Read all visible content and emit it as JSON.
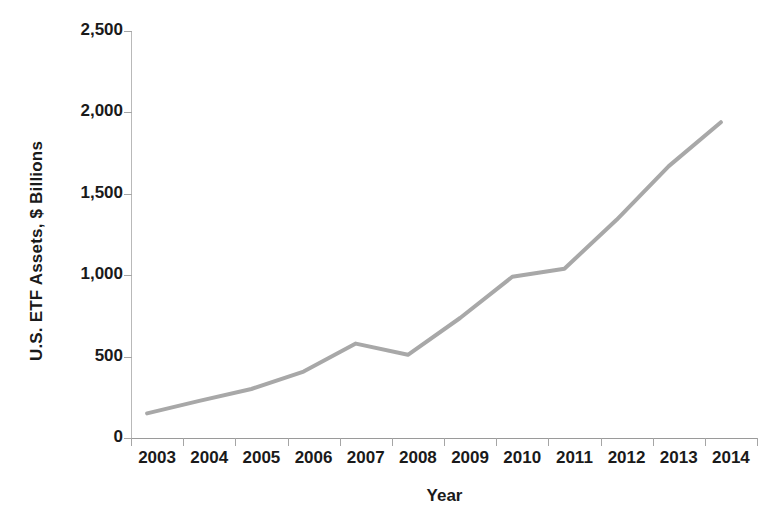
{
  "chart_data": {
    "type": "line",
    "title": "",
    "xlabel": "Year",
    "ylabel": "U.S. ETF Assets, $ Billions",
    "categories": [
      "2003",
      "2004",
      "2005",
      "2006",
      "2007",
      "2008",
      "2009",
      "2010",
      "2011",
      "2012",
      "2013",
      "2014"
    ],
    "x": [
      2003,
      2004,
      2005,
      2006,
      2007,
      2008,
      2009,
      2010,
      2011,
      2012,
      2013,
      2014
    ],
    "values": [
      151,
      228,
      301,
      408,
      580,
      511,
      737,
      990,
      1040,
      1340,
      1670,
      1940
    ],
    "series": [
      {
        "name": "U.S. ETF Assets",
        "values": [
          151,
          228,
          301,
          408,
          580,
          511,
          737,
          990,
          1040,
          1340,
          1670,
          1940
        ]
      }
    ],
    "ylim": [
      0,
      2500
    ],
    "yticks": [
      0,
      500,
      1000,
      1500,
      2000,
      2500
    ],
    "ytick_labels": [
      "0",
      "500",
      "1,000",
      "1,500",
      "2,000",
      "2,500"
    ],
    "grid": false,
    "legend": false,
    "line_color": "#a8a8a8",
    "axis_color": "#a5a5a5",
    "text_color": "#1a1a1a",
    "background": "#ffffff"
  }
}
